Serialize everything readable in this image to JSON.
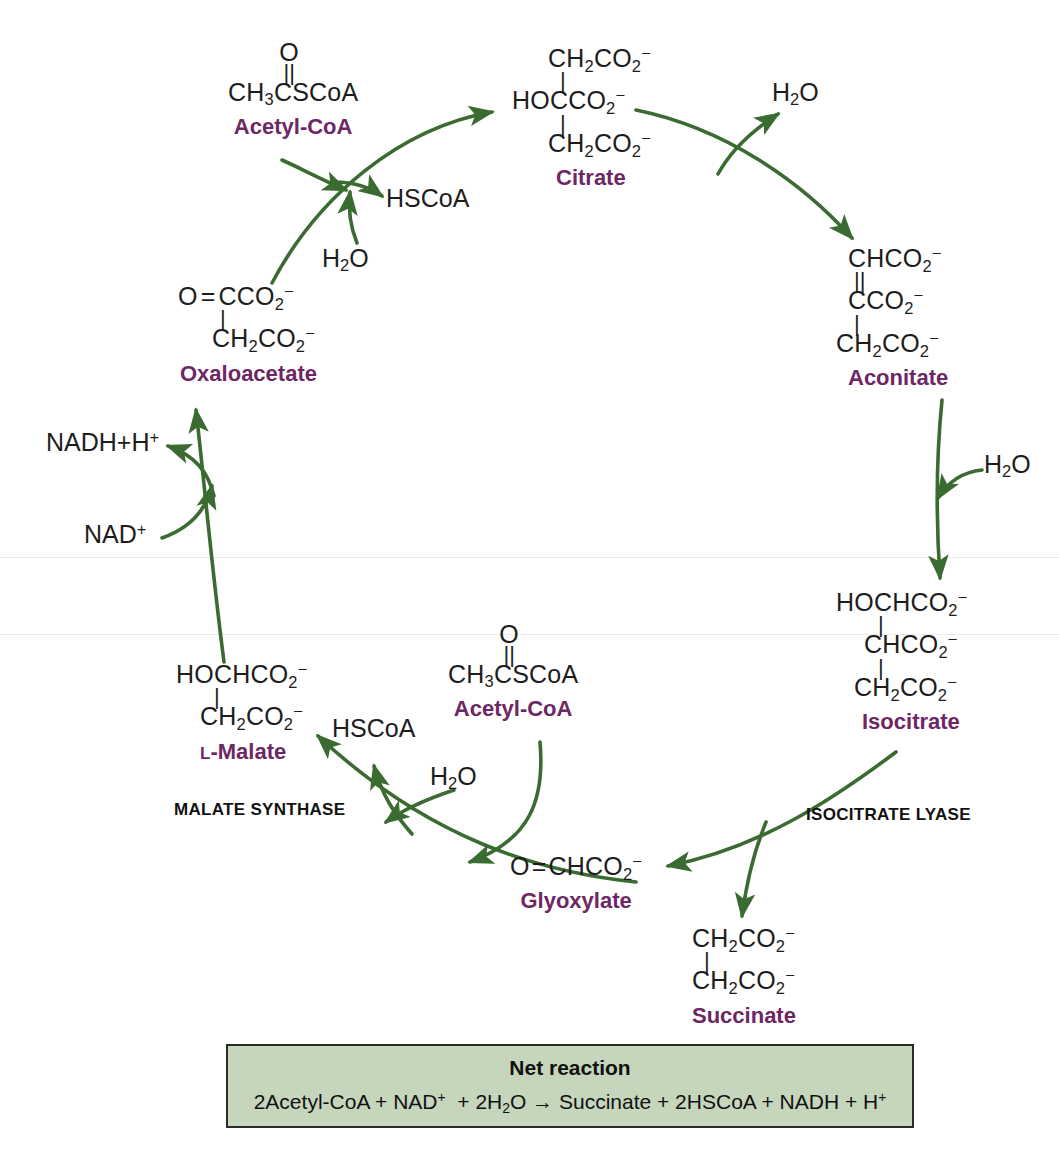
{
  "diagram": {
    "accent_purple": "#6d2764",
    "arrow_green": "#3a6b30",
    "net_box_fill": "#c6d6bd",
    "net_box_border": "#2b2b2b"
  },
  "metabolites": {
    "acetyl_coa_top": {
      "line_o": "O",
      "bond": "||",
      "line_formula": "CH3CSCoA",
      "label": "Acetyl-CoA"
    },
    "citrate": {
      "line1": "CH2CO2-",
      "bond1": "|",
      "line2": "HOCCO2-",
      "bond2": "|",
      "line3": "CH2CO2-",
      "label": "Citrate"
    },
    "aconitate": {
      "line1": "CHCO2-",
      "bond1": "||",
      "line2": "CCO2-",
      "bond2": "|",
      "line3": "CH2CO2-",
      "label": "Aconitate"
    },
    "isocitrate": {
      "line1": "HOCHCO2-",
      "bond1": "|",
      "line2": "CHCO2-",
      "bond2": "|",
      "line3": "CH2CO2-",
      "label": "Isocitrate"
    },
    "succinate": {
      "line1": "CH2CO2-",
      "bond1": "|",
      "line2": "CH2CO2-",
      "label": "Succinate"
    },
    "glyoxylate": {
      "line1": "O=CHCO2-",
      "label": "Glyoxylate"
    },
    "malate": {
      "line1": "HOCHCO2-",
      "bond1": "|",
      "line2": "CH2CO2-",
      "label_prefix": "L",
      "label": "-Malate"
    },
    "acetyl_coa_bottom": {
      "line_o": "O",
      "bond": "||",
      "line_formula": "CH3CSCoA",
      "label": "Acetyl-CoA"
    },
    "oxaloacetate": {
      "line1": "O=CCO2-",
      "bond1": "|",
      "line2": "CH2CO2-",
      "label": "Oxaloacetate"
    }
  },
  "cofactors": {
    "hscoa_top": "HSCoA",
    "water_top_in": "H2O",
    "water_citrate_out": "H2O",
    "water_aconitate_in": "H2O",
    "nadh_h": "NADH+H+",
    "nad_plus": "NAD+",
    "hscoa_bottom": "HSCoA",
    "water_bottom_in": "H2O"
  },
  "enzymes": {
    "malate_synthase": "MALATE SYNTHASE",
    "isocitrate_lyase": "ISOCITRATE LYASE"
  },
  "net_reaction": {
    "title": "Net reaction",
    "equation": "2Acetyl-CoA + NAD+  + 2H2O → Succinate + 2HSCoA + NADH + H+"
  }
}
